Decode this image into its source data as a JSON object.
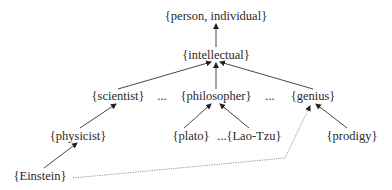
{
  "diagram": {
    "type": "wordnet-hypernym-hierarchy",
    "nodes": {
      "person": "{person, individual}",
      "intellectual": "{intellectual}",
      "scientist": "{scientist}",
      "ellipsis1": "...",
      "philosopher": "{philosopher}",
      "ellipsis2": "...",
      "genius": "{genius}",
      "physicist": "{physicist}",
      "plato": "{plato}",
      "ellipsis3": "...",
      "laotzu": "{Lao-Tzu}",
      "prodigy": "{prodigy}",
      "einstein": "{Einstein}"
    },
    "edges": [
      {
        "from": "intellectual",
        "to": "person",
        "style": "solid-arrow"
      },
      {
        "from": "scientist",
        "to": "intellectual",
        "style": "solid-arrow"
      },
      {
        "from": "philosopher",
        "to": "intellectual",
        "style": "solid-arrow"
      },
      {
        "from": "genius",
        "to": "intellectual",
        "style": "solid-arrow"
      },
      {
        "from": "physicist",
        "to": "scientist",
        "style": "solid-arrow"
      },
      {
        "from": "plato",
        "to": "philosopher",
        "style": "solid-arrow"
      },
      {
        "from": "laotzu",
        "to": "philosopher",
        "style": "solid-arrow"
      },
      {
        "from": "prodigy",
        "to": "genius",
        "style": "solid-arrow"
      },
      {
        "from": "einstein",
        "to": "physicist",
        "style": "solid-arrow"
      },
      {
        "from": "einstein",
        "to": "genius",
        "style": "dotted-arrow"
      }
    ],
    "colors": {
      "text": "#2a2a2a",
      "edge": "#333333",
      "dotted_edge": "#888888"
    }
  }
}
